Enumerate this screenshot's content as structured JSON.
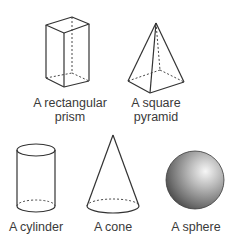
{
  "shapes": [
    {
      "id": "rectangular-prism",
      "label_line1": "A rectangular",
      "label_line2": "prism"
    },
    {
      "id": "square-pyramid",
      "label_line1": "A square",
      "label_line2": "pyramid"
    },
    {
      "id": "cylinder",
      "label_line1": "A cylinder"
    },
    {
      "id": "cone",
      "label_line1": "A cone"
    },
    {
      "id": "sphere",
      "label_line1": "A sphere"
    }
  ],
  "colors": {
    "stroke": "#333333",
    "text": "#3a3a3a",
    "sphere_light": "#f4f4f4",
    "sphere_dark": "#4a4a4a"
  }
}
